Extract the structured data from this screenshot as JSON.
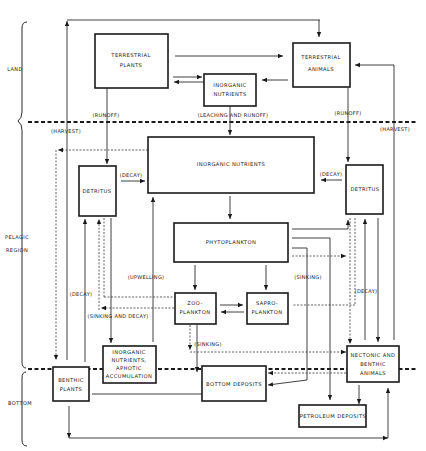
{
  "regions": {
    "land": "LAND",
    "pelagic_line1": "PELAGIC",
    "pelagic_line2": "REGION",
    "bottom": "BOTTOM"
  },
  "boxes": {
    "terrestrial_plants": [
      "TERRESTRIAL",
      "PLANTS"
    ],
    "terrestrial_animals": [
      "TERRESTRIAL",
      "ANIMALS"
    ],
    "inorganic_nutrients_land": [
      "INORGANIC",
      "NUTRIENTS"
    ],
    "inorganic_nutrients_main": "INORGANIC NUTRIENTS",
    "detritus_left": "DETRITUS",
    "detritus_right": "DETRITUS",
    "phytoplankton": "PHYTOPLANKTON",
    "zooplankton": [
      "ZOO-",
      "PLANKTON"
    ],
    "saproplankton": [
      "SAPRO-",
      "PLANKTON"
    ],
    "inorganic_aphotic": [
      "INORGANIC",
      "NUTRIENTS,",
      "APHOTIC",
      "ACCUMULATION"
    ],
    "benthic_plants": [
      "BENTHIC",
      "PLANTS"
    ],
    "bottom_deposits": "BOTTOM DEPOSITS",
    "nectonic_benthic": [
      "NECTONIC AND",
      "BENTHIC",
      "ANIMALS"
    ],
    "petroleum_deposits": "PETROLEUM DEPOSITS"
  },
  "labels": {
    "runoff_left": "(RUNOFF)",
    "runoff_right": "(RUNOFF)",
    "leaching_runoff": "(LEACHING AND RUNOFF)",
    "harvest_left": "(HARVEST)",
    "harvest_right": "(HARVEST)",
    "decay_left": "(DECAY)",
    "decay_right": "(DECAY)",
    "decay_lower_left": "(DECAY)",
    "decay_lower_right": "(DECAY)",
    "upwelling": "(UPWELLING)",
    "sinking_right": "(SINKING)",
    "sinking_and_decay": "(SINKING AND DECAY)",
    "sinking_lower": "(SINKING)"
  }
}
